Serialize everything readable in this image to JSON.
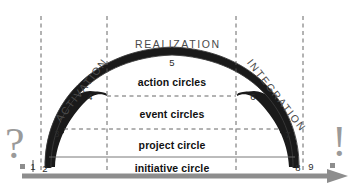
{
  "diagram": {
    "phases": [
      {
        "name": "activation-label",
        "text": "ACTIVATION",
        "x": 62,
        "y": 112,
        "rotate": -52
      },
      {
        "name": "realization-label",
        "text": "REALIZATION",
        "x": 135,
        "y": 38,
        "rotate": 0
      },
      {
        "name": "integration-label",
        "text": "INTEGRATION",
        "x": 245,
        "y": 52,
        "rotate": 52
      }
    ],
    "bands": [
      {
        "name": "action-circles",
        "text": "action circles",
        "x": 172,
        "y": 82
      },
      {
        "name": "event-circles",
        "text": "event circles",
        "x": 172,
        "y": 114
      },
      {
        "name": "project-circle",
        "text": "project circle",
        "x": 172,
        "y": 145
      },
      {
        "name": "initiative-circle",
        "text": "initiative circle",
        "x": 172,
        "y": 168
      }
    ],
    "nodes": [
      {
        "id": "node-1",
        "label": "1",
        "x": 33,
        "y": 166
      },
      {
        "id": "node-2",
        "label": "2",
        "x": 45,
        "y": 168
      },
      {
        "id": "node-3",
        "label": "3",
        "x": 57,
        "y": 133
      },
      {
        "id": "node-4",
        "label": "4",
        "x": 90,
        "y": 96
      },
      {
        "id": "node-5",
        "label": "5",
        "x": 172,
        "y": 62
      },
      {
        "id": "node-6",
        "label": "6",
        "x": 253,
        "y": 96
      },
      {
        "id": "node-7",
        "label": "7",
        "x": 288,
        "y": 134
      },
      {
        "id": "node-8",
        "label": "8",
        "x": 298,
        "y": 167
      },
      {
        "id": "node-9",
        "label": "9",
        "x": 311,
        "y": 166
      }
    ],
    "marks": [
      {
        "name": "question-mark",
        "glyph": "?"
      },
      {
        "name": "exclamation-mark",
        "glyph": "!"
      }
    ],
    "guides": {
      "vertical_dashed_x": [
        41,
        107,
        236,
        303
      ],
      "horizontal_dashed_y": [
        96,
        129
      ],
      "solid_baseline_y": 157,
      "axis_y": 176
    },
    "colors": {
      "fill_dark": "#1a1a1a",
      "stroke_thin": "#3a3a3a",
      "dashed": "#555555",
      "axis_gray": "#8d8d8d",
      "mark_gray": "#9a9a9a",
      "band_text": "#111111",
      "phase_text": "#4a4a4a"
    }
  }
}
